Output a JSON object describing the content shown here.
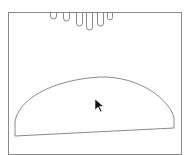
{
  "canvas": {
    "background": "#ffffff",
    "stroke": "#8a8a8a",
    "frame": {
      "x": 8,
      "y": 12,
      "width": 173,
      "height": 142
    }
  },
  "shapes": {
    "fingers": [
      {
        "x": 50,
        "width": 6,
        "bottom": 19
      },
      {
        "x": 63,
        "width": 6,
        "bottom": 21
      },
      {
        "x": 76,
        "width": 6,
        "bottom": 26
      },
      {
        "x": 86,
        "width": 6,
        "bottom": 30
      },
      {
        "x": 97,
        "width": 6,
        "bottom": 26
      },
      {
        "x": 107,
        "width": 5,
        "bottom": 20
      }
    ],
    "dome": {
      "path": "M15,136 L15,122 C18,100 50,80 100,77 C140,76 170,100 174,118 L174,128 Z"
    }
  },
  "cursor": {
    "x": 95,
    "y": 99,
    "icon": "arrow-pointer-icon"
  }
}
